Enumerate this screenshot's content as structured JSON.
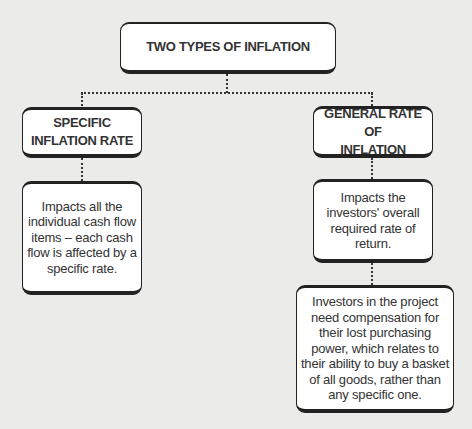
{
  "diagram": {
    "title": "TWO TYPES OF INFLATION",
    "branches": [
      {
        "heading_line1": "SPECIFIC",
        "heading_line2": "INFLATION RATE",
        "description": "Impacts all the individual cash flow items – each cash flow is affected by a specific rate."
      },
      {
        "heading_line1": "GENERAL RATE OF",
        "heading_line2": "INFLATION",
        "description": "Impacts the investors' overall required rate of return.",
        "detail": "Investors in the project need compensation for their lost purchasing power, which relates to their ability to buy a basket of all goods, rather than any specific one."
      }
    ]
  },
  "colors": {
    "background": "#ebebea",
    "box_fill": "#ffffff",
    "border": "#222222",
    "text": "#333333"
  }
}
